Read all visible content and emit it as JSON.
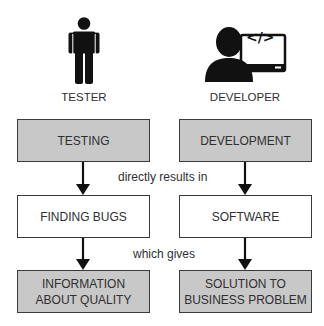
{
  "roles": {
    "tester": {
      "label": "TESTER",
      "icon": "person-icon"
    },
    "developer": {
      "label": "DEVELOPER",
      "icon": "developer-computer-icon",
      "screen_glyph": "</>"
    }
  },
  "columns": {
    "tester": {
      "activity": "TESTING",
      "result": "FINDING BUGS",
      "outcome_line1": "INFORMATION",
      "outcome_line2": "ABOUT QUALITY"
    },
    "developer": {
      "activity": "DEVELOPMENT",
      "result": "SOFTWARE",
      "outcome_line1": "SOLUTION TO",
      "outcome_line2": "BUSINESS PROBLEM"
    }
  },
  "connectors": {
    "first": "directly results in",
    "second": "which gives"
  },
  "colors": {
    "shaded_fill": "#c8c8c8",
    "border": "#3a3a3a",
    "text": "#2f2f2f",
    "icon": "#111111"
  }
}
